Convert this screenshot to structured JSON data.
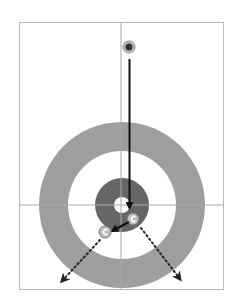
{
  "diagram": {
    "type": "curling-shot-diagram",
    "colors": {
      "background": "#ffffff",
      "frame": "#b8b8b8",
      "outer_ring": "#9e9e9e",
      "inner_ring": "#ffffff",
      "four_foot": "#666666",
      "button": "#ffffff",
      "path": "#111111",
      "stone_fill": "#bdbdbd",
      "stone_handle": "#ffffff"
    },
    "elements": {
      "thrower_stone": "delivered stone at top",
      "shot_path": "straight line down to the house",
      "hit_stone_1": "stone near button (right)",
      "hit_stone_2": "stone at lower left of four-foot",
      "deflect_left": "dotted path to bottom-left",
      "deflect_right": "dotted path to bottom-right"
    }
  }
}
